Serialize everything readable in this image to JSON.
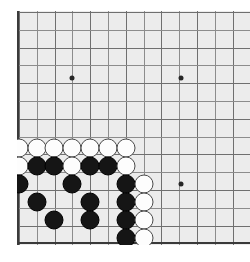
{
  "board": {
    "kind": "go-board",
    "view": "bottom-left-corner",
    "size": 19,
    "background_color": "#ececec",
    "line_color": "#8c8c8c",
    "strong_line_color": "#6f6f6f",
    "edge_color": "#3a3a3a",
    "black_stone_color": "#151515",
    "white_stone_color": "#fdfdfd",
    "page_background": "#ffffff",
    "origin_x": 19,
    "origin_y": 12,
    "spacing": 17.8,
    "cols": 13,
    "rows": 13,
    "star_points": [
      {
        "cx": 72,
        "cy": 78
      },
      {
        "cx": 181,
        "cy": 78
      },
      {
        "cx": 181,
        "cy": 184
      }
    ],
    "stones": [
      {
        "color": "white",
        "cx": 19,
        "cy": 148
      },
      {
        "color": "white",
        "cx": 37,
        "cy": 148
      },
      {
        "color": "white",
        "cx": 54,
        "cy": 148
      },
      {
        "color": "white",
        "cx": 72,
        "cy": 148
      },
      {
        "color": "white",
        "cx": 90,
        "cy": 148
      },
      {
        "color": "white",
        "cx": 108,
        "cy": 148
      },
      {
        "color": "white",
        "cx": 126,
        "cy": 148
      },
      {
        "color": "white",
        "cx": 19,
        "cy": 166
      },
      {
        "color": "black",
        "cx": 37,
        "cy": 166
      },
      {
        "color": "black",
        "cx": 54,
        "cy": 166
      },
      {
        "color": "white",
        "cx": 72,
        "cy": 166
      },
      {
        "color": "black",
        "cx": 90,
        "cy": 166
      },
      {
        "color": "black",
        "cx": 108,
        "cy": 166
      },
      {
        "color": "white",
        "cx": 126,
        "cy": 166
      },
      {
        "color": "black",
        "cx": 19,
        "cy": 184
      },
      {
        "color": "black",
        "cx": 72,
        "cy": 184
      },
      {
        "color": "black",
        "cx": 126,
        "cy": 184
      },
      {
        "color": "white",
        "cx": 144,
        "cy": 184
      },
      {
        "color": "black",
        "cx": 37,
        "cy": 202
      },
      {
        "color": "black",
        "cx": 90,
        "cy": 202
      },
      {
        "color": "black",
        "cx": 126,
        "cy": 202
      },
      {
        "color": "white",
        "cx": 144,
        "cy": 202
      },
      {
        "color": "black",
        "cx": 54,
        "cy": 220
      },
      {
        "color": "black",
        "cx": 90,
        "cy": 220
      },
      {
        "color": "black",
        "cx": 126,
        "cy": 220
      },
      {
        "color": "white",
        "cx": 144,
        "cy": 220
      },
      {
        "color": "black",
        "cx": 126,
        "cy": 238
      },
      {
        "color": "white",
        "cx": 144,
        "cy": 238
      }
    ]
  }
}
